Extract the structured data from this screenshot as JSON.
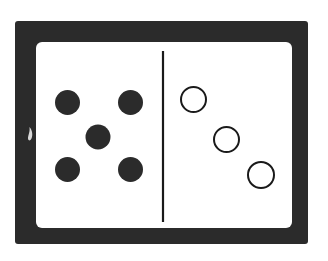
{
  "figure": {
    "title": "Comparison of filled and open circle groups separated by a vertical line",
    "caption": "",
    "background_color": "#ffffff"
  },
  "canvas": {
    "width": 328,
    "height": 261
  },
  "frame": {
    "name": "dark-border-frame",
    "border_color": "#2b2b2b",
    "inner_fill": "#ffffff",
    "outer_rect": {
      "x": 15,
      "y": 21,
      "width": 293,
      "height": 223
    },
    "inner_rect": {
      "x": 36,
      "y": 42,
      "width": 256,
      "height": 186
    },
    "corner_radius": 6
  },
  "divider": {
    "name": "vertical-divider-line",
    "color": "#1a1a1a",
    "stroke_width": 2,
    "x": 163,
    "y_start": 51,
    "y_end": 222
  },
  "left_group": {
    "label": "filled-dots-group",
    "count": 5,
    "fill_color": "#2b2b2b",
    "stroke_color": "#2b2b2b",
    "style": "filled",
    "arrangement": "quincunx",
    "dots": [
      {
        "id": "filled-dot-top-left",
        "cx": 67.5,
        "cy": 102.5,
        "r": 12.5
      },
      {
        "id": "filled-dot-top-right",
        "cx": 130.5,
        "cy": 102.5,
        "r": 12.5
      },
      {
        "id": "filled-dot-center",
        "cx": 98.0,
        "cy": 137.0,
        "r": 12.5
      },
      {
        "id": "filled-dot-bottom-left",
        "cx": 67.5,
        "cy": 169.5,
        "r": 12.5
      },
      {
        "id": "filled-dot-bottom-right",
        "cx": 130.5,
        "cy": 169.5,
        "r": 12.5
      }
    ]
  },
  "right_group": {
    "label": "open-circles-group",
    "count": 3,
    "fill_color": "#ffffff",
    "stroke_color": "#1a1a1a",
    "stroke_width": 2,
    "style": "outline",
    "arrangement": "diagonal-descending",
    "circles": [
      {
        "id": "open-circle-upper",
        "cx": 193.5,
        "cy": 99.5,
        "r": 13.5
      },
      {
        "id": "open-circle-middle",
        "cx": 226.5,
        "cy": 139.5,
        "r": 13.5
      },
      {
        "id": "open-circle-lower",
        "cx": 261.0,
        "cy": 175.0,
        "r": 14.0
      }
    ]
  },
  "artifact": {
    "name": "edge-scan-mark",
    "description": "small light crescent mark on the left border",
    "color": "#d8d8d8",
    "x": 27,
    "y": 127,
    "width": 6,
    "height": 14
  }
}
